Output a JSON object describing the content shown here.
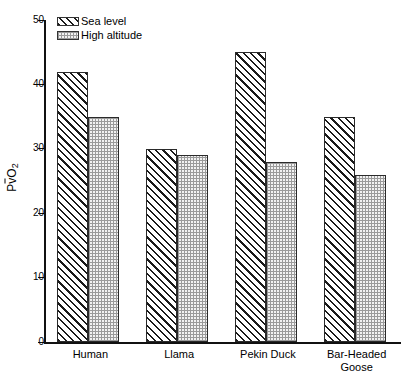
{
  "chart_data": {
    "type": "bar",
    "title": "",
    "xlabel": "",
    "ylabel": "PvO2",
    "ylabel_parts": {
      "pre": "P",
      "overbar": "v",
      "sub": "2",
      "post": "O"
    },
    "categories": [
      "Human",
      "Llama",
      "Pekin Duck",
      "Bar-Headed Goose"
    ],
    "category_lines": [
      [
        "Human"
      ],
      [
        "Llama"
      ],
      [
        "Pekin Duck"
      ],
      [
        "Bar-Headed",
        "Goose"
      ]
    ],
    "series": [
      {
        "name": "Sea level",
        "pattern": "diagonal-hatch",
        "values": [
          42,
          30,
          45,
          35
        ]
      },
      {
        "name": "High altitude",
        "pattern": "dot-stipple",
        "values": [
          35,
          29,
          28,
          26
        ]
      }
    ],
    "ylim": [
      0,
      50
    ],
    "yticks": [
      0,
      10,
      20,
      30,
      40,
      50
    ],
    "ytick_labels": [
      "0",
      "10",
      "20",
      "30",
      "40",
      "50"
    ],
    "grid": false,
    "legend_position": "top-left"
  },
  "legend": {
    "items": [
      {
        "label": "Sea level",
        "swatch": "hatch-swatch"
      },
      {
        "label": "High altitude",
        "swatch": "dots-swatch"
      }
    ]
  },
  "colors": {
    "axis": "#111111",
    "bar_outline": "#2a2a2a",
    "hatch_line": "#1a1a1a",
    "dot_fill": "#f2f2f2",
    "dot_mark": "#9a9a9a",
    "background": "#ffffff"
  }
}
